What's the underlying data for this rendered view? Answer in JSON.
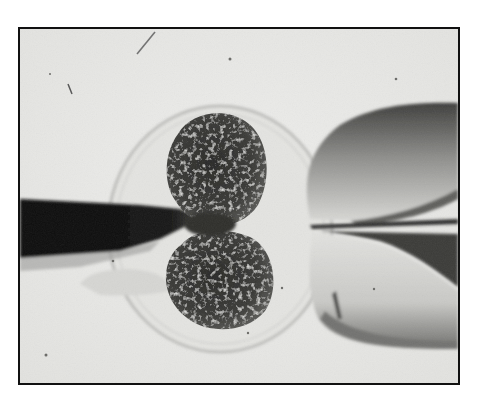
{
  "image": {
    "description": "Grayscale micrograph of a two-cell embryo inside its zona pellucida, held by a holding pipette on the right while a micro-needle enters from the left",
    "style": "black-and-white photomicrograph with thin black border",
    "colors": {
      "page_background": "#ffffff",
      "border": "#111111",
      "field_background": "#e9e9e7",
      "cell_dark": "#2e2e2c",
      "pipette_dark": "#0d0d0d",
      "holding_pipette_mid": "#7a7a78"
    },
    "elements": [
      "micro-needle (left)",
      "zona pellucida (outer membrane ring)",
      "blastomere (upper)",
      "blastomere (lower)",
      "holding pipette (right)",
      "debris specks"
    ]
  }
}
